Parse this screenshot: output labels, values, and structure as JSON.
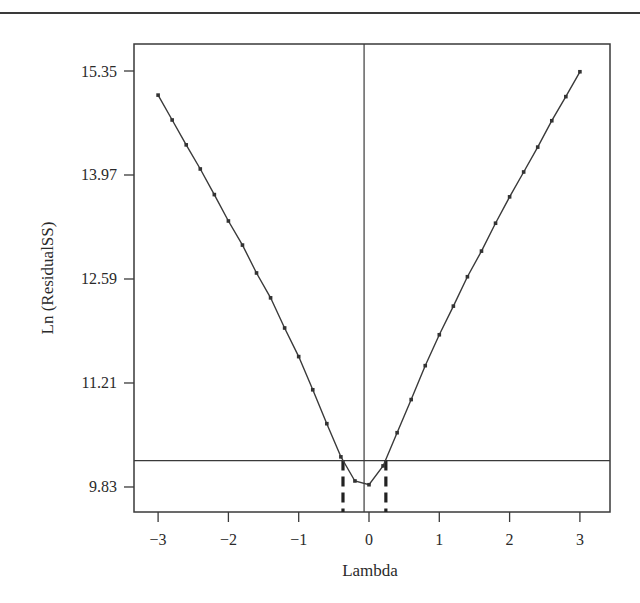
{
  "chart_data": {
    "type": "line",
    "title": "",
    "xlabel": "Lambda",
    "ylabel": "Ln (ResidualSS)",
    "xlim": [
      -3.35,
      3.35
    ],
    "ylim": [
      9.5,
      15.7
    ],
    "x_ticks": [
      -3,
      -2,
      -1,
      0,
      1,
      2,
      3
    ],
    "x_tick_labels": [
      "−3",
      "−2",
      "−1",
      "0",
      "1",
      "2",
      "3"
    ],
    "y_ticks": [
      15.35,
      13.97,
      12.59,
      11.21,
      9.83
    ],
    "y_tick_labels": [
      "15.35",
      "13.97",
      "12.59",
      "11.21",
      "9.83"
    ],
    "grid": false,
    "legend": null,
    "series": [
      {
        "name": "Ln(ResidualSS)",
        "x": [
          -3.0,
          -2.8,
          -2.6,
          -2.4,
          -2.2,
          -2.0,
          -1.8,
          -1.6,
          -1.4,
          -1.2,
          -1.0,
          -0.8,
          -0.6,
          -0.4,
          -0.2,
          0.0,
          0.2,
          0.4,
          0.6,
          0.8,
          1.0,
          1.2,
          1.4,
          1.6,
          1.8,
          2.0,
          2.2,
          2.4,
          2.6,
          2.8,
          3.0
        ],
        "values": [
          15.03,
          14.7,
          14.37,
          14.05,
          13.71,
          13.36,
          13.04,
          12.67,
          12.34,
          11.94,
          11.56,
          11.12,
          10.67,
          10.23,
          9.91,
          9.86,
          10.11,
          10.55,
          10.99,
          11.44,
          11.85,
          12.23,
          12.62,
          12.96,
          13.33,
          13.68,
          14.01,
          14.34,
          14.69,
          15.01,
          15.34
        ]
      }
    ],
    "annotations": {
      "horizontal_line_y": 10.18,
      "vertical_line_x": -0.07,
      "dashed_ci_lines_x": [
        -0.37,
        0.24
      ]
    }
  }
}
